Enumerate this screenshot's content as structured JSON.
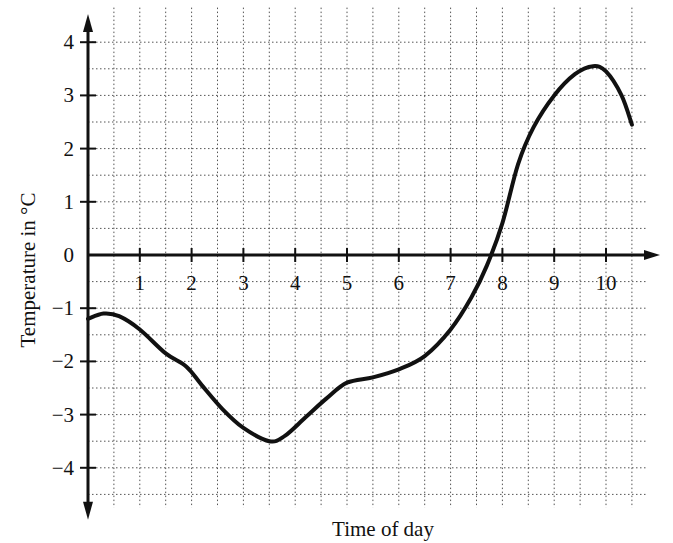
{
  "chart_data": {
    "type": "line",
    "title": "",
    "xlabel": "Time of day",
    "ylabel": "Temperature in °C",
    "xlim": [
      0,
      10.5
    ],
    "ylim": [
      -4.5,
      4.5
    ],
    "grid": true,
    "grid_step": 0.5,
    "legend": "none",
    "x_ticks": [
      "1",
      "2",
      "3",
      "4",
      "5",
      "6",
      "7",
      "8",
      "9",
      "10"
    ],
    "y_ticks": [
      "4",
      "3",
      "2",
      "1",
      "0",
      "-1",
      "-2",
      "-3",
      "-4"
    ],
    "series": [
      {
        "name": "Temperature",
        "x": [
          0,
          0.3,
          0.6,
          1.0,
          1.5,
          1.9,
          2.2,
          2.6,
          3.0,
          3.5,
          3.8,
          4.2,
          4.6,
          5.0,
          5.5,
          6.0,
          6.5,
          7.0,
          7.4,
          7.7,
          8.0,
          8.3,
          8.6,
          9.0,
          9.4,
          9.75,
          10.0,
          10.3,
          10.5
        ],
        "y": [
          -1.2,
          -1.1,
          -1.15,
          -1.4,
          -1.85,
          -2.1,
          -2.45,
          -2.9,
          -3.25,
          -3.5,
          -3.4,
          -3.05,
          -2.7,
          -2.4,
          -2.3,
          -2.15,
          -1.9,
          -1.4,
          -0.8,
          -0.2,
          0.6,
          1.7,
          2.4,
          3.0,
          3.4,
          3.55,
          3.45,
          3.0,
          2.45
        ]
      }
    ]
  }
}
